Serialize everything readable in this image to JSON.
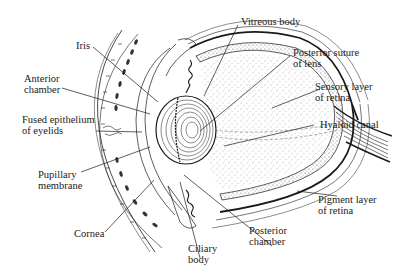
{
  "diagram": {
    "title": "",
    "colors": {
      "ink": "#1a1a1a",
      "background": "#ffffff",
      "stipple": "#555555"
    },
    "labels": [
      {
        "id": "vitreous-body",
        "line1": "Vitreous body",
        "line2": ""
      },
      {
        "id": "iris",
        "line1": "Iris",
        "line2": ""
      },
      {
        "id": "posterior-suture-of-lens",
        "line1": "Posterior suture",
        "line2": "of lens"
      },
      {
        "id": "anterior-chamber",
        "line1": "Anterior",
        "line2": "chamber"
      },
      {
        "id": "sensory-layer-of-retina",
        "line1": "Sensory layer",
        "line2": "of retina"
      },
      {
        "id": "fused-epithelium-of-eyelids",
        "line1": "Fused epithelium",
        "line2": "of eyelids"
      },
      {
        "id": "hyaloid-canal",
        "line1": "Hyaloid canal",
        "line2": ""
      },
      {
        "id": "pupillary-membrane",
        "line1": "Pupillary",
        "line2": "membrane"
      },
      {
        "id": "pigment-layer-of-retina",
        "line1": "Pigment layer",
        "line2": "of retina"
      },
      {
        "id": "cornea",
        "line1": "Cornea",
        "line2": ""
      },
      {
        "id": "posterior-chamber",
        "line1": "Posterior",
        "line2": "chamber"
      },
      {
        "id": "ciliary-body",
        "line1": "Ciliary",
        "line2": "body"
      }
    ]
  }
}
